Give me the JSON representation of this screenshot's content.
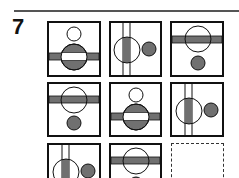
{
  "question": {
    "number": "7",
    "type": "matrix-reasoning"
  },
  "colors": {
    "fill": "#707070",
    "stroke": "#111111",
    "rule": "#555555"
  },
  "grid": {
    "rows": 3,
    "cols": 3,
    "cells": [
      {
        "row": 1,
        "col": 1,
        "pattern": "small-open-circle-top, big-grey-circle-center, horizontal-band (white inside circle)"
      },
      {
        "row": 1,
        "col": 2,
        "pattern": "big-open-circle-left, vertical-band (grey inside circle), small-grey-circle-right"
      },
      {
        "row": 1,
        "col": 3,
        "pattern": "big-open-circle-top, horizontal-band (grey), small-grey-circle-bottom"
      },
      {
        "row": 2,
        "col": 1,
        "pattern": "big-open-circle-top, horizontal-band (grey), small-grey-circle-bottom"
      },
      {
        "row": 2,
        "col": 2,
        "pattern": "small-open-circle-top, big-grey-circle-center, horizontal-band (white inside circle)"
      },
      {
        "row": 2,
        "col": 3,
        "pattern": "big-open-circle-left, vertical-band (grey inside circle), small-grey-circle-right"
      },
      {
        "row": 3,
        "col": 1,
        "pattern": "big-open-circle-left, vertical-band (grey inside circle), small-grey-circle-right"
      },
      {
        "row": 3,
        "col": 2,
        "pattern": "big-open-circle-top, horizontal-band (grey), small-grey-circle-bottom"
      },
      {
        "row": 3,
        "col": 3,
        "pattern": "missing (dashed answer box)"
      }
    ]
  }
}
